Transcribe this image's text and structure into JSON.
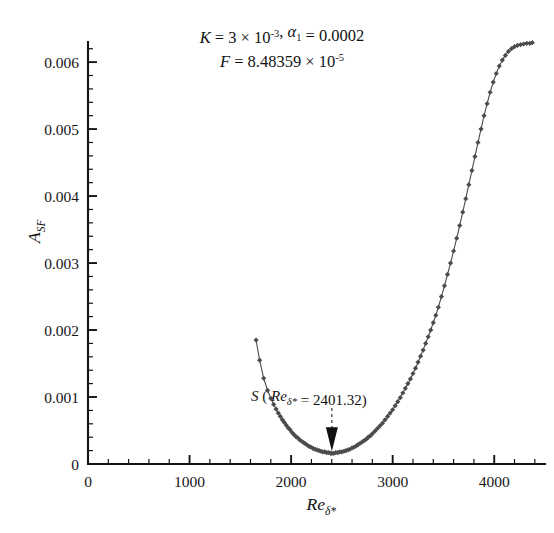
{
  "figure": {
    "background": "#ffffff",
    "ink_color": "#141414",
    "marker_color": "#4c4c4c"
  },
  "chart_data": {
    "type": "line",
    "title_lines": [
      {
        "parts": [
          {
            "text": "K",
            "style": "italic"
          },
          {
            "text": " = 3 × 10",
            "style": "normal"
          },
          {
            "text": "-3",
            "style": "superscript"
          },
          {
            "text": ", ",
            "style": "normal"
          },
          {
            "text": "α",
            "style": "italic"
          },
          {
            "text": "1",
            "style": "subscript"
          },
          {
            "text": " = 0.0002",
            "style": "normal"
          }
        ]
      },
      {
        "parts": [
          {
            "text": "F",
            "style": "italic"
          },
          {
            "text": " = 8.48359 × 10",
            "style": "normal"
          },
          {
            "text": "-5",
            "style": "superscript"
          }
        ]
      }
    ],
    "xlabel": "Re",
    "xlabel_sub": "δ*",
    "ylabel": "A",
    "ylabel_sub": "SF",
    "xlim": [
      0,
      4500
    ],
    "ylim": [
      0,
      0.0063
    ],
    "x_major_ticks": [
      0,
      1000,
      2000,
      3000,
      4000
    ],
    "x_major_tick_labels": [
      "0",
      "1000",
      "2000",
      "3000",
      "4000"
    ],
    "x_minor_step": 200,
    "y_major_ticks": [
      0,
      0.001,
      0.002,
      0.003,
      0.004,
      0.005,
      0.006
    ],
    "y_major_tick_labels": [
      "0",
      "0.001",
      "0.002",
      "0.003",
      "0.004",
      "0.005",
      "0.006"
    ],
    "y_minor_step": 0.0002,
    "grid": false,
    "legend": "none",
    "marker_shape": "diamond",
    "annotations": [
      {
        "name": "minimum-point-label",
        "text_parts": [
          {
            "text": "S",
            "style": "italic"
          },
          {
            "text": " ( ",
            "style": "normal"
          },
          {
            "text": "Re",
            "style": "italic"
          },
          {
            "text": "δ*",
            "style": "subscript-italic"
          },
          {
            "text": " = 2401.32)",
            "style": "normal"
          }
        ],
        "text_flat": "S ( Reδ* = 2401.32)",
        "target_x": 2401.32,
        "target_y": 0.00016
      }
    ],
    "series": [
      {
        "name": "A_SF neutral curve",
        "x": [
          1655,
          1690,
          1730,
          1768,
          1800,
          1828,
          1852,
          1874,
          1894,
          1914,
          1933,
          1952,
          1971,
          1990,
          2009,
          2028,
          2047,
          2066,
          2085,
          2104,
          2123,
          2142,
          2161,
          2180,
          2199,
          2218,
          2237,
          2256,
          2275,
          2294,
          2313,
          2332,
          2351,
          2370,
          2389,
          2401,
          2420,
          2440,
          2460,
          2480,
          2500,
          2520,
          2540,
          2560,
          2580,
          2600,
          2620,
          2640,
          2660,
          2680,
          2700,
          2720,
          2740,
          2760,
          2780,
          2800,
          2825,
          2850,
          2875,
          2900,
          2925,
          2950,
          2975,
          3000,
          3025,
          3050,
          3075,
          3100,
          3125,
          3150,
          3175,
          3200,
          3225,
          3250,
          3275,
          3300,
          3325,
          3350,
          3375,
          3400,
          3425,
          3450,
          3480,
          3510,
          3540,
          3570,
          3600,
          3630,
          3660,
          3690,
          3720,
          3750,
          3780,
          3810,
          3840,
          3870,
          3900,
          3930,
          3960,
          3990,
          4020,
          4050,
          4080,
          4110,
          4140,
          4170,
          4200,
          4230,
          4260,
          4290,
          4320,
          4350,
          4375
        ],
        "y": [
          0.00185,
          0.00155,
          0.00128,
          0.0011,
          0.00098,
          0.00089,
          0.00082,
          0.00076,
          0.00071,
          0.00066,
          0.00062,
          0.00058,
          0.00054,
          0.00051,
          0.00047,
          0.00044,
          0.00041,
          0.00039,
          0.00036,
          0.00034,
          0.00032,
          0.0003,
          0.00028,
          0.00026,
          0.00025,
          0.00023,
          0.00022,
          0.00021,
          0.0002,
          0.00019,
          0.00018,
          0.00018,
          0.00017,
          0.00017,
          0.00016,
          0.00016,
          0.00016,
          0.00017,
          0.00017,
          0.00018,
          0.00018,
          0.00019,
          0.0002,
          0.00021,
          0.00022,
          0.00024,
          0.00025,
          0.00027,
          0.00029,
          0.00031,
          0.00033,
          0.00035,
          0.00037,
          0.0004,
          0.00042,
          0.00045,
          0.00049,
          0.00053,
          0.00057,
          0.00061,
          0.00066,
          0.00071,
          0.00076,
          0.00081,
          0.00087,
          0.00093,
          0.00099,
          0.00106,
          0.00113,
          0.0012,
          0.00127,
          0.00135,
          0.00143,
          0.00152,
          0.00161,
          0.0017,
          0.0018,
          0.0019,
          0.002,
          0.00211,
          0.00222,
          0.00234,
          0.0025,
          0.00266,
          0.00283,
          0.003,
          0.00318,
          0.00337,
          0.00356,
          0.00376,
          0.00396,
          0.00417,
          0.00438,
          0.00459,
          0.0048,
          0.005,
          0.0052,
          0.00538,
          0.00555,
          0.0057,
          0.00583,
          0.00594,
          0.00603,
          0.0061,
          0.00616,
          0.0062,
          0.00623,
          0.00625,
          0.00626,
          0.00627,
          0.00628,
          0.00628,
          0.00629
        ]
      }
    ]
  }
}
